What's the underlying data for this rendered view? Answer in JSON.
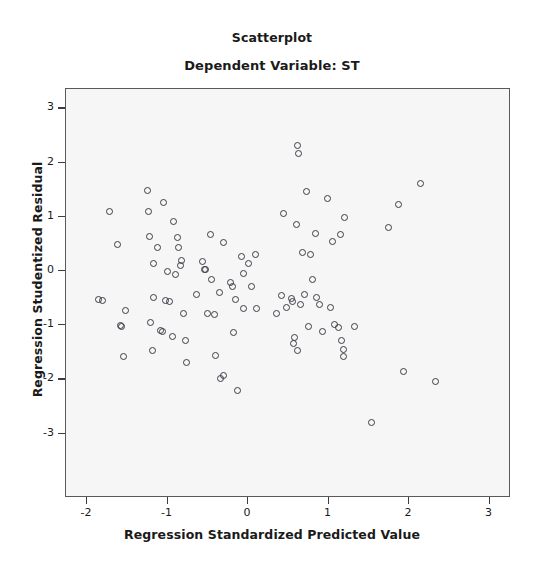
{
  "chart_data": {
    "type": "scatter",
    "title": "Scatterplot",
    "subtitle": "Dependent Variable: ST",
    "xlabel": "Regression Standardized Predicted Value",
    "ylabel": "Regression Studentized Residual",
    "xlim": [
      -2.4,
      3.3
    ],
    "ylim": [
      -3.35,
      3.3
    ],
    "xticks": [
      -2,
      -1,
      0,
      1,
      2,
      3
    ],
    "xtick_labels": [
      "-2",
      "-1",
      "0",
      "1",
      "2",
      "3"
    ],
    "yticks": [
      -3,
      -2,
      -1,
      0,
      1,
      2,
      3
    ],
    "ytick_labels": [
      "-3",
      "-2",
      "-1",
      "0",
      "1",
      "2",
      "3"
    ],
    "grid": false,
    "legend": null,
    "marker": "open-circle",
    "marker_color": "#3c3c46",
    "plot_background": "#f6f6f6",
    "n_points": 97,
    "points": [
      {
        "x": -1.86,
        "y": -0.52
      },
      {
        "x": -1.81,
        "y": -0.55
      },
      {
        "x": -1.72,
        "y": 1.1
      },
      {
        "x": -1.62,
        "y": 0.48
      },
      {
        "x": -1.58,
        "y": -1.0
      },
      {
        "x": -1.57,
        "y": -1.02
      },
      {
        "x": -1.55,
        "y": -1.57
      },
      {
        "x": -1.52,
        "y": -0.72
      },
      {
        "x": -1.25,
        "y": 1.48
      },
      {
        "x": -1.24,
        "y": 1.09
      },
      {
        "x": -1.22,
        "y": 0.63
      },
      {
        "x": -1.21,
        "y": -0.95
      },
      {
        "x": -1.19,
        "y": -1.46
      },
      {
        "x": -1.18,
        "y": 0.13
      },
      {
        "x": -1.17,
        "y": -0.49
      },
      {
        "x": -1.13,
        "y": 0.43
      },
      {
        "x": -1.09,
        "y": -1.09
      },
      {
        "x": -1.06,
        "y": -1.11
      },
      {
        "x": -1.05,
        "y": 1.26
      },
      {
        "x": -1.02,
        "y": -0.55
      },
      {
        "x": -1.0,
        "y": 0.0
      },
      {
        "x": -0.97,
        "y": -0.57
      },
      {
        "x": -0.94,
        "y": -1.2
      },
      {
        "x": -0.93,
        "y": 0.92
      },
      {
        "x": -0.9,
        "y": -0.06
      },
      {
        "x": -0.88,
        "y": 0.62
      },
      {
        "x": -0.86,
        "y": 0.43
      },
      {
        "x": -0.84,
        "y": 0.11
      },
      {
        "x": -0.82,
        "y": 0.2
      },
      {
        "x": -0.8,
        "y": -0.78
      },
      {
        "x": -0.78,
        "y": -1.29
      },
      {
        "x": -0.76,
        "y": -1.68
      },
      {
        "x": -0.64,
        "y": -0.43
      },
      {
        "x": -0.56,
        "y": 0.18
      },
      {
        "x": -0.54,
        "y": 0.02
      },
      {
        "x": -0.53,
        "y": 0.02
      },
      {
        "x": -0.5,
        "y": -0.79
      },
      {
        "x": -0.47,
        "y": 0.67
      },
      {
        "x": -0.45,
        "y": -0.15
      },
      {
        "x": -0.42,
        "y": -0.8
      },
      {
        "x": -0.4,
        "y": -1.55
      },
      {
        "x": -0.36,
        "y": -0.4
      },
      {
        "x": -0.34,
        "y": -1.99
      },
      {
        "x": -0.31,
        "y": -1.92
      },
      {
        "x": -0.3,
        "y": 0.52
      },
      {
        "x": -0.22,
        "y": -0.22
      },
      {
        "x": -0.19,
        "y": -0.28
      },
      {
        "x": -0.18,
        "y": -1.13
      },
      {
        "x": -0.15,
        "y": -0.52
      },
      {
        "x": -0.13,
        "y": -2.2
      },
      {
        "x": -0.08,
        "y": 0.26
      },
      {
        "x": -0.06,
        "y": -0.05
      },
      {
        "x": -0.05,
        "y": -0.7
      },
      {
        "x": 0.01,
        "y": 0.14
      },
      {
        "x": 0.04,
        "y": -0.28
      },
      {
        "x": 0.09,
        "y": 0.31
      },
      {
        "x": 0.11,
        "y": -0.7
      },
      {
        "x": 0.35,
        "y": -0.78
      },
      {
        "x": 0.41,
        "y": -0.45
      },
      {
        "x": 0.44,
        "y": 1.07
      },
      {
        "x": 0.48,
        "y": -0.68
      },
      {
        "x": 0.54,
        "y": -0.5
      },
      {
        "x": 0.55,
        "y": -0.57
      },
      {
        "x": 0.56,
        "y": -1.33
      },
      {
        "x": 0.58,
        "y": -1.23
      },
      {
        "x": 0.6,
        "y": 0.85
      },
      {
        "x": 0.61,
        "y": 2.32
      },
      {
        "x": 0.62,
        "y": -1.46
      },
      {
        "x": 0.63,
        "y": 2.16
      },
      {
        "x": 0.65,
        "y": -0.61
      },
      {
        "x": 0.68,
        "y": 0.35
      },
      {
        "x": 0.7,
        "y": -0.44
      },
      {
        "x": 0.73,
        "y": 1.47
      },
      {
        "x": 0.75,
        "y": -1.03
      },
      {
        "x": 0.78,
        "y": 0.31
      },
      {
        "x": 0.8,
        "y": -0.16
      },
      {
        "x": 0.84,
        "y": 0.7
      },
      {
        "x": 0.85,
        "y": -0.49
      },
      {
        "x": 0.89,
        "y": -0.61
      },
      {
        "x": 0.92,
        "y": -1.12
      },
      {
        "x": 0.99,
        "y": 1.33
      },
      {
        "x": 1.02,
        "y": -0.67
      },
      {
        "x": 1.05,
        "y": 0.54
      },
      {
        "x": 1.08,
        "y": -0.98
      },
      {
        "x": 1.12,
        "y": -1.04
      },
      {
        "x": 1.15,
        "y": 0.67
      },
      {
        "x": 1.16,
        "y": -1.29
      },
      {
        "x": 1.19,
        "y": -1.44
      },
      {
        "x": 1.19,
        "y": -1.58
      },
      {
        "x": 1.2,
        "y": 0.98
      },
      {
        "x": 1.32,
        "y": -1.02
      },
      {
        "x": 1.53,
        "y": -2.79
      },
      {
        "x": 1.75,
        "y": 0.81
      },
      {
        "x": 1.87,
        "y": 1.22
      },
      {
        "x": 1.93,
        "y": -1.85
      },
      {
        "x": 2.14,
        "y": 1.62
      },
      {
        "x": 2.33,
        "y": -2.03
      }
    ]
  }
}
